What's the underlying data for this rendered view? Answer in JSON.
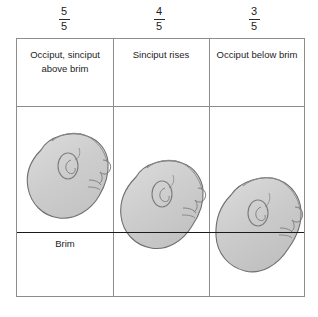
{
  "figure": {
    "brim_label": "Brim",
    "colors": {
      "head_fill": "#c9c9c9",
      "head_fill_light": "#d4d4d4",
      "head_outline": "#6f6f6f",
      "table_border": "#8d8d8d",
      "brim_line": "#1a1a1a",
      "text": "#1d1d1d",
      "background": "#ffffff"
    },
    "columns": [
      {
        "fraction_numerator": "5",
        "fraction_denominator": "5",
        "header": "Occiput, sinciput above brim",
        "header_lines": [
          "Occiput,",
          "sinciput",
          "above brim"
        ],
        "head_position": "entirely above brim",
        "fifths_palpable": 5
      },
      {
        "fraction_numerator": "4",
        "fraction_denominator": "5",
        "header": "Sinciput rises",
        "header_lines": [
          "Sinciput",
          "rises"
        ],
        "head_position": "lower pole crosses brim",
        "fifths_palpable": 4
      },
      {
        "fraction_numerator": "3",
        "fraction_denominator": "5",
        "header": "Occiput below brim",
        "header_lines": [
          "Occiput below",
          "brim"
        ],
        "head_position": "occiput descended below brim",
        "fifths_palpable": 3
      }
    ]
  }
}
